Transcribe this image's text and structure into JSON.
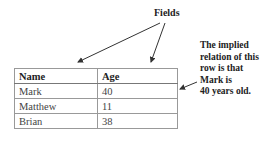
{
  "callouts": {
    "fields": "Fields",
    "relation_note": [
      "The implied",
      "relation of this",
      "row is that",
      "Mark is",
      "40 years old."
    ]
  },
  "table": {
    "headers": [
      "Name",
      "Age"
    ],
    "rows": [
      [
        "Mark",
        "40"
      ],
      [
        "Matthew",
        "11"
      ],
      [
        "Brian",
        "38"
      ]
    ]
  }
}
